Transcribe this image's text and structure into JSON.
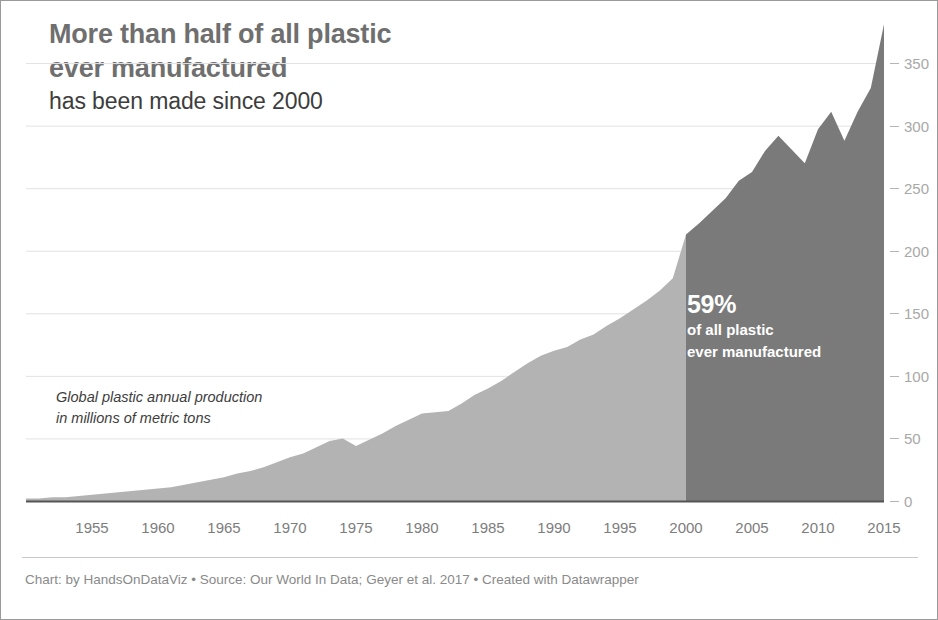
{
  "header": {
    "title_lines": [
      "More than half of all plastic",
      "ever manufactured"
    ],
    "subtitle": "has been made since 2000"
  },
  "annotations": {
    "series_label_lines": [
      "Global plastic annual production",
      "in millions of metric tons"
    ],
    "highlight_percent": "59%",
    "highlight_lines": [
      "of all plastic",
      "ever manufactured"
    ]
  },
  "footer": {
    "note": "Chart: by HandsOnDataViz • Source: Our World In Data; Geyer et al. 2017 • Created with Datawrapper"
  },
  "colors": {
    "area_light": "#b3b3b3",
    "area_dark": "#7a7a7a",
    "title": "#6f6f6f",
    "subtitle": "#3d3d3d",
    "axis_text": "#7d7d7d",
    "y_axis_text": "#a8a8a8",
    "footer_text": "#8a8a8a",
    "baseline": "#555555",
    "frame": "#9a9a9a"
  },
  "chart_data": {
    "type": "area",
    "title": "More than half of all plastic ever manufactured has been made since 2000",
    "xlabel": "",
    "ylabel": "Global plastic annual production in millions of metric tons",
    "xlim": [
      1950,
      2015
    ],
    "ylim": [
      0,
      390
    ],
    "grid": true,
    "legend_position": "none",
    "y_ticks": [
      0,
      50,
      100,
      150,
      200,
      250,
      300,
      350
    ],
    "x_ticks": [
      1955,
      1960,
      1965,
      1970,
      1975,
      1980,
      1985,
      1990,
      1995,
      2000,
      2005,
      2010,
      2015
    ],
    "highlight_split_year": 2000,
    "highlight_share_percent": 59,
    "series": [
      {
        "name": "Global plastic annual production (million metric tons)",
        "x": [
          1950,
          1951,
          1952,
          1953,
          1954,
          1955,
          1956,
          1957,
          1958,
          1959,
          1960,
          1961,
          1962,
          1963,
          1964,
          1965,
          1966,
          1967,
          1968,
          1969,
          1970,
          1971,
          1972,
          1973,
          1974,
          1975,
          1976,
          1977,
          1978,
          1979,
          1980,
          1981,
          1982,
          1983,
          1984,
          1985,
          1986,
          1987,
          1988,
          1989,
          1990,
          1991,
          1992,
          1993,
          1994,
          1995,
          1996,
          1997,
          1998,
          1999,
          2000,
          2001,
          2002,
          2003,
          2004,
          2005,
          2006,
          2007,
          2008,
          2009,
          2010,
          2011,
          2012,
          2013,
          2014,
          2015
        ],
        "values": [
          2,
          2,
          3,
          3,
          4,
          5,
          6,
          7,
          8,
          9,
          10,
          11,
          13,
          15,
          17,
          19,
          22,
          24,
          27,
          31,
          35,
          38,
          43,
          48,
          50,
          44,
          49,
          54,
          60,
          65,
          70,
          71,
          72,
          78,
          85,
          90,
          96,
          103,
          110,
          116,
          120,
          123,
          129,
          133,
          140,
          146,
          153,
          160,
          168,
          178,
          213,
          222,
          232,
          242,
          256,
          263,
          280,
          292,
          281,
          270,
          297,
          311,
          288,
          311,
          330,
          381
        ]
      }
    ]
  }
}
